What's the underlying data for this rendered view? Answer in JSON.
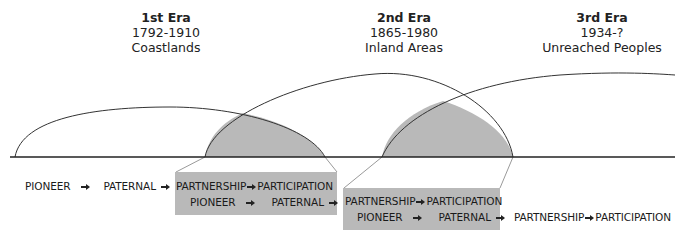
{
  "eras": [
    {
      "name": "1st Era",
      "years": "1792-1910",
      "region": "Coastlands"
    },
    {
      "name": "2nd Era",
      "years": "1865-1980",
      "region": "Inland Areas"
    },
    {
      "name": "3rd Era",
      "years": "1934-?",
      "region": "Unreached Peoples"
    }
  ],
  "stages": {
    "pioneer": "PIONEER",
    "paternal": "PATERNAL",
    "partnership": "PARTNERSHIP",
    "participation": "PARTICIPATION"
  },
  "colors": {
    "shade": "#b9b9b9",
    "line": "#333333",
    "connector": "#9a9a9a"
  }
}
